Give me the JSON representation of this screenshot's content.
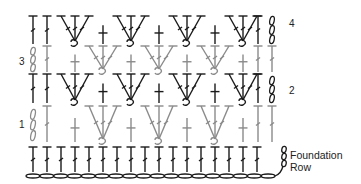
{
  "diagram": {
    "colors": {
      "dark": "#1a1a1a",
      "light": "#8a8a8a",
      "background": "#ffffff"
    },
    "row_labels": [
      {
        "text": "4",
        "x": 289,
        "y": 24
      },
      {
        "text": "3",
        "x": 19,
        "y": 62
      },
      {
        "text": "2",
        "x": 289,
        "y": 91
      },
      {
        "text": "1",
        "x": 19,
        "y": 125
      }
    ],
    "foundation_label": {
      "line1": "Foundation",
      "line2": "Row",
      "x": 290,
      "y": 149
    },
    "foundation": {
      "chain_y": 176,
      "chain_start_x": 26,
      "chain_end_x": 275,
      "chain_count": 18,
      "stitch_xs": [
        33,
        47,
        61,
        75,
        89,
        103,
        117,
        131,
        145,
        159,
        173,
        187,
        201,
        215,
        229,
        243,
        257,
        271
      ],
      "stitch_top": 147,
      "stitch_bottom": 172
    },
    "rows": [
      {
        "id": "row1",
        "color": "light",
        "top": 105,
        "bottom": 142,
        "edge_dc": [
          47
        ],
        "edge_dc_right": [
          258,
          272
        ],
        "turn_chain": {
          "x": 33,
          "top": 109,
          "bottom": 141
        },
        "fans": [
          103,
          159,
          215
        ],
        "posts": [
          75,
          131,
          187,
          243
        ]
      },
      {
        "id": "row2",
        "color": "dark",
        "top": 73,
        "bottom": 103,
        "edge_dc": [
          33,
          47
        ],
        "edge_dc_right": [
          258
        ],
        "turn_chain": {
          "x": 272,
          "top": 76,
          "bottom": 103
        },
        "fans": [
          75,
          131,
          187,
          243
        ],
        "posts": [
          103,
          159,
          215
        ]
      },
      {
        "id": "row3",
        "color": "light",
        "top": 45,
        "bottom": 72,
        "edge_dc": [
          47
        ],
        "edge_dc_right": [
          258,
          272
        ],
        "turn_chain": {
          "x": 33,
          "top": 47,
          "bottom": 72
        },
        "fans": [
          103,
          159,
          215
        ],
        "posts": [
          75,
          131,
          187,
          243
        ]
      },
      {
        "id": "row4",
        "color": "dark",
        "top": 15,
        "bottom": 44,
        "edge_dc": [
          33,
          47
        ],
        "edge_dc_right": [
          258
        ],
        "turn_chain": {
          "x": 272,
          "top": 16,
          "bottom": 44
        },
        "fans": [
          75,
          131,
          187,
          243
        ],
        "posts": [
          103,
          159,
          215
        ]
      }
    ]
  }
}
